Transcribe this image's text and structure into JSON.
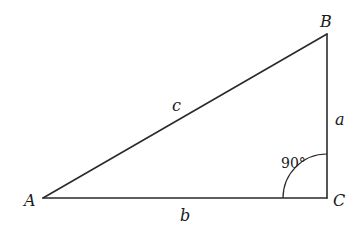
{
  "diagram": {
    "type": "right-triangle",
    "vertices": {
      "A": {
        "label": "A",
        "x": 43,
        "y": 198
      },
      "B": {
        "label": "B",
        "x": 327,
        "y": 34
      },
      "C": {
        "label": "C",
        "x": 327,
        "y": 198
      }
    },
    "sides": {
      "a": {
        "label": "a",
        "from": "B",
        "to": "C"
      },
      "b": {
        "label": "b",
        "from": "A",
        "to": "C"
      },
      "c": {
        "label": "c",
        "from": "A",
        "to": "B"
      }
    },
    "right_angle": {
      "vertex": "C",
      "label": "90°",
      "marker": "arc"
    },
    "colors": {
      "line": "#2a2a2a",
      "text": "#1a1a1a",
      "background": "#ffffff"
    }
  }
}
